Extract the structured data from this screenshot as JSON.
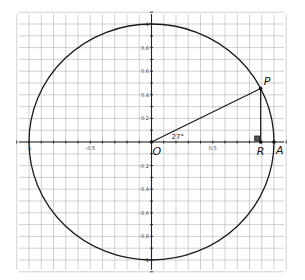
{
  "diagram": {
    "type": "unit-circle",
    "center_label": "O",
    "angle_label": "27°",
    "points": [
      {
        "id": "O",
        "label": "O",
        "x": 0,
        "y": 0
      },
      {
        "id": "P",
        "label": "P",
        "x": 0.891,
        "y": 0.454
      },
      {
        "id": "R",
        "label": "R",
        "x": 0.891,
        "y": 0
      },
      {
        "id": "A",
        "label": "A",
        "x": 1,
        "y": 0
      }
    ],
    "x_tick_labels": [
      {
        "value": -1,
        "label": "-1"
      },
      {
        "value": -0.5,
        "label": "-0.5"
      },
      {
        "value": 0.5,
        "label": "0.5"
      }
    ],
    "y_tick_labels": [
      {
        "value": 1,
        "label": "1"
      },
      {
        "value": 0.8,
        "label": "0.8"
      },
      {
        "value": 0.6,
        "label": "0.6"
      },
      {
        "value": 0.4,
        "label": "0.4"
      },
      {
        "value": 0.2,
        "label": "0.2"
      },
      {
        "value": -0.2,
        "label": "-0.2"
      },
      {
        "value": -0.4,
        "label": "-0.4"
      },
      {
        "value": -0.6,
        "label": "-0.6"
      },
      {
        "value": -0.8,
        "label": "-0.8"
      },
      {
        "value": -1,
        "label": "-1"
      }
    ],
    "grid_step": 0.1,
    "x_range": [
      -1.1,
      1.1
    ],
    "y_range": [
      -1.1,
      1.1
    ],
    "right_angle_marker_at": "R",
    "colors": {
      "grid": "#bdbdbd",
      "lines": "#1a1a1a",
      "background": "#ffffff"
    }
  }
}
